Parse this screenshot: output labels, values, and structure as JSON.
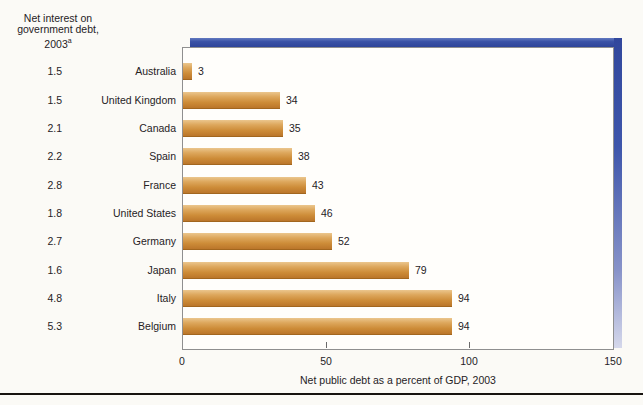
{
  "left_column": {
    "heading_line1": "Net interest on",
    "heading_line2": "government debt,",
    "heading_line3": "2003",
    "heading_superscript": "a"
  },
  "chart_data": {
    "type": "bar",
    "orientation": "horizontal",
    "xlabel": "Net public debt as a percent of GDP, 2003",
    "xlim": [
      0,
      150
    ],
    "x_ticks": [
      0,
      50,
      100,
      150
    ],
    "x_tick_labels": [
      "0",
      "50",
      "100",
      "150"
    ],
    "grid": false,
    "legend": "none",
    "categories": [
      "Australia",
      "United Kingdom",
      "Canada",
      "Spain",
      "France",
      "United States",
      "Germany",
      "Japan",
      "Italy",
      "Belgium"
    ],
    "series": [
      {
        "name": "Net public debt as a percent of GDP, 2003",
        "values": [
          3,
          34,
          35,
          38,
          43,
          46,
          52,
          79,
          94,
          94
        ]
      },
      {
        "name": "Net interest on government debt, 2003",
        "values": [
          1.5,
          1.5,
          2.1,
          2.2,
          2.8,
          1.8,
          2.7,
          1.6,
          4.8,
          5.3
        ]
      }
    ],
    "rows": [
      {
        "country": "Australia",
        "net_interest": "1.5",
        "debt": 3,
        "debt_label": "3"
      },
      {
        "country": "United Kingdom",
        "net_interest": "1.5",
        "debt": 34,
        "debt_label": "34"
      },
      {
        "country": "Canada",
        "net_interest": "2.1",
        "debt": 35,
        "debt_label": "35"
      },
      {
        "country": "Spain",
        "net_interest": "2.2",
        "debt": 38,
        "debt_label": "38"
      },
      {
        "country": "France",
        "net_interest": "2.8",
        "debt": 43,
        "debt_label": "43"
      },
      {
        "country": "United States",
        "net_interest": "1.8",
        "debt": 46,
        "debt_label": "46"
      },
      {
        "country": "Germany",
        "net_interest": "2.7",
        "debt": 52,
        "debt_label": "52"
      },
      {
        "country": "Japan",
        "net_interest": "1.6",
        "debt": 79,
        "debt_label": "79"
      },
      {
        "country": "Italy",
        "net_interest": "4.8",
        "debt": 94,
        "debt_label": "94"
      },
      {
        "country": "Belgium",
        "net_interest": "5.3",
        "debt": 94,
        "debt_label": "94"
      }
    ],
    "colors": {
      "bar_light": "#ebc68d",
      "bar_mid": "#cd8c38",
      "bar_dark": "#bb762a",
      "accent_blue": "#3a52a6",
      "plot_border": "#8f8f8f",
      "text": "#26221f",
      "background": "#fbfaf6"
    }
  }
}
